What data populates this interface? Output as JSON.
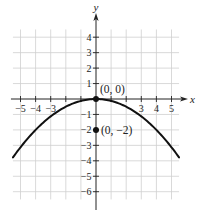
{
  "chart_data": {
    "type": "line",
    "title": "",
    "function": "y = -x^2/8",
    "xlabel": "x",
    "ylabel": "y",
    "xlim": [
      -5.5,
      5.5
    ],
    "ylim": [
      -6.5,
      4.5
    ],
    "grid": true,
    "x_ticks": [
      -5,
      -4,
      -3,
      3,
      4,
      5
    ],
    "x_tick_labels": [
      "−5",
      "−4",
      "−3",
      "3",
      "4",
      "5"
    ],
    "y_ticks": [
      4,
      3,
      2,
      1,
      -1,
      -2,
      -3,
      -4,
      -5,
      -6
    ],
    "y_tick_labels": [
      "4",
      "3",
      "2",
      "1",
      "−1",
      "−2",
      "−3",
      "−4",
      "−5",
      "−6"
    ],
    "series": [
      {
        "name": "parabola",
        "x": [
          -5.5,
          -5,
          -4,
          -3,
          -2,
          -1,
          0,
          1,
          2,
          3,
          4,
          5,
          5.5
        ],
        "y": [
          -3.78,
          -3.125,
          -2,
          -1.125,
          -0.5,
          -0.125,
          0,
          -0.125,
          -0.5,
          -1.125,
          -2,
          -3.125,
          -3.78
        ]
      }
    ],
    "points": [
      {
        "x": 0,
        "y": 0,
        "label": "(0, 0)",
        "role": "vertex"
      },
      {
        "x": 0,
        "y": -2,
        "label": "(0, −2)",
        "role": "focus"
      }
    ],
    "colors": {
      "curve": "#111111",
      "grid": "#cfcfcf",
      "axis": "#222222"
    }
  }
}
